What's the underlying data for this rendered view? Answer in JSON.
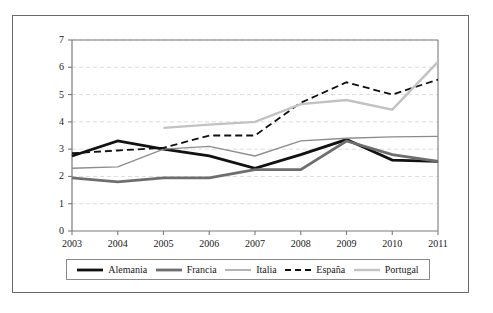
{
  "chart_data": {
    "type": "line",
    "title": "",
    "subtitle": "",
    "xlabel": "",
    "ylabel": "",
    "x": [
      2003,
      2004,
      2005,
      2006,
      2007,
      2008,
      2009,
      2010,
      2011
    ],
    "categories": [
      "2003",
      "2004",
      "2005",
      "2006",
      "2007",
      "2008",
      "2009",
      "2010",
      "2011"
    ],
    "xlim": [
      2003,
      2011
    ],
    "ylim": [
      0,
      7
    ],
    "y_ticks": [
      "0",
      "1",
      "2",
      "3",
      "4",
      "5",
      "6",
      "7"
    ],
    "y_tick_values": [
      0,
      1,
      2,
      3,
      4,
      5,
      6,
      7
    ],
    "grid": "horizontal-dashed",
    "legend_position": "bottom",
    "series": [
      {
        "name": "Alemania",
        "color": "#111111",
        "width": 2.8,
        "dash": "solid",
        "values": [
          2.75,
          3.3,
          3.0,
          2.75,
          2.3,
          2.8,
          3.35,
          2.6,
          2.55
        ]
      },
      {
        "name": "Francia",
        "color": "#6e6e6e",
        "width": 2.8,
        "dash": "solid",
        "values": [
          1.95,
          1.8,
          1.95,
          1.95,
          2.25,
          2.25,
          3.3,
          2.8,
          2.55
        ]
      },
      {
        "name": "Italia",
        "color": "#8c8c8c",
        "width": 1.3,
        "dash": "solid",
        "values": [
          2.3,
          2.35,
          3.0,
          3.1,
          2.75,
          3.3,
          3.4,
          3.45,
          3.47
        ]
      },
      {
        "name": "España",
        "color": "#111111",
        "width": 1.8,
        "dash": "dashed",
        "values": [
          2.85,
          2.95,
          3.05,
          3.5,
          3.5,
          4.7,
          5.45,
          5.0,
          5.55
        ]
      },
      {
        "name": "Portugal",
        "color": "#c2c2c2",
        "width": 2.4,
        "dash": "solid",
        "values": [
          null,
          null,
          3.78,
          3.9,
          4.0,
          4.65,
          4.8,
          4.45,
          6.2
        ]
      }
    ]
  },
  "legend": {
    "items": [
      {
        "label": "Alemania",
        "icon": "line-swatch-solid-black"
      },
      {
        "label": "Francia",
        "icon": "line-swatch-solid-darkgray"
      },
      {
        "label": "Italia",
        "icon": "line-swatch-thin-gray"
      },
      {
        "label": "España",
        "icon": "line-swatch-dashed-black"
      },
      {
        "label": "Portugal",
        "icon": "line-swatch-solid-lightgray"
      }
    ]
  },
  "axes": {
    "y_labels": [
      "7",
      "6",
      "5",
      "4",
      "3",
      "2",
      "1",
      "0"
    ],
    "x_labels": [
      "2003",
      "2004",
      "2005",
      "2006",
      "2007",
      "2008",
      "2009",
      "2010",
      "2011"
    ]
  },
  "colors": {
    "frame": "#6b6b6b",
    "axis": "#7a7a7a",
    "grid": "#d9d9d9",
    "background": "#ffffff",
    "text": "#1a1a1a"
  }
}
